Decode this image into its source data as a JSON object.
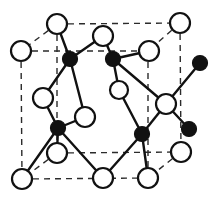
{
  "figure": {
    "name": "diamond-cubic-unit-cell",
    "title": "",
    "caption": "",
    "background_color": "#ffffff",
    "line_color": "#111111",
    "dashed_edge_color": "#2b2b2b",
    "open_atom_fill": "#ffffff",
    "filled_atom_fill": "#111111",
    "atom_radius_open": 10,
    "atom_radius_filled": 7.5,
    "bond_width": 2.4,
    "edge_dash_pattern": "6 5"
  },
  "chart_data": {
    "type": "scatter",
    "xlabel": "",
    "ylabel": "",
    "xlim": [
      0,
      212
    ],
    "ylim": [
      0,
      201
    ],
    "grid": false,
    "legend": [
      {
        "label": "open circle atom",
        "marker": "circle-open",
        "color": "#ffffff"
      },
      {
        "label": "filled circle atom",
        "marker": "circle-filled",
        "color": "#111111"
      }
    ],
    "atoms": [
      {
        "id": "o1",
        "x": 57,
        "y": 24,
        "type": "open",
        "r": 10,
        "position": "top-back-left-corner"
      },
      {
        "id": "o2",
        "x": 180,
        "y": 23,
        "type": "open",
        "r": 10,
        "position": "top-back-right-corner"
      },
      {
        "id": "o3",
        "x": 21,
        "y": 51,
        "type": "open",
        "r": 10,
        "position": "top-front-left-corner"
      },
      {
        "id": "o4",
        "x": 103,
        "y": 36,
        "type": "open",
        "r": 10,
        "position": "top-face-center-left"
      },
      {
        "id": "o5",
        "x": 149,
        "y": 51,
        "type": "open",
        "r": 10,
        "position": "top-face-center-right"
      },
      {
        "id": "o6",
        "x": 43,
        "y": 98,
        "type": "open",
        "r": 10,
        "position": "left-face-center"
      },
      {
        "id": "o7",
        "x": 119,
        "y": 90,
        "type": "open",
        "r": 9,
        "position": "interior-upper-center"
      },
      {
        "id": "o8",
        "x": 85,
        "y": 117,
        "type": "open",
        "r": 10,
        "position": "interior-lower-center"
      },
      {
        "id": "o9",
        "x": 166,
        "y": 104,
        "type": "open",
        "r": 10,
        "position": "right-face-center"
      },
      {
        "id": "o10",
        "x": 57,
        "y": 153,
        "type": "open",
        "r": 10,
        "position": "front-face-center-left"
      },
      {
        "id": "o11",
        "x": 181,
        "y": 152,
        "type": "open",
        "r": 10,
        "position": "bottom-back-right-corner"
      },
      {
        "id": "o12",
        "x": 22,
        "y": 179,
        "type": "open",
        "r": 10,
        "position": "bottom-front-left-corner"
      },
      {
        "id": "o13",
        "x": 103,
        "y": 178,
        "type": "open",
        "r": 10,
        "position": "bottom-face-center"
      },
      {
        "id": "o14",
        "x": 148,
        "y": 178,
        "type": "open",
        "r": 10,
        "position": "bottom-front-right-corner"
      },
      {
        "id": "f1",
        "x": 70,
        "y": 59,
        "type": "filled",
        "r": 7.5,
        "position": "tetrahedral-upper-left"
      },
      {
        "id": "f2",
        "x": 113,
        "y": 59,
        "type": "filled",
        "r": 7.5,
        "position": "tetrahedral-upper-center"
      },
      {
        "id": "f3",
        "x": 200,
        "y": 63,
        "type": "filled",
        "r": 7.5,
        "position": "tetrahedral-upper-right-outside"
      },
      {
        "id": "f4",
        "x": 58,
        "y": 128,
        "type": "filled",
        "r": 7.5,
        "position": "tetrahedral-lower-left"
      },
      {
        "id": "f5",
        "x": 142,
        "y": 134,
        "type": "filled",
        "r": 7.5,
        "position": "tetrahedral-lower-center"
      },
      {
        "id": "f6",
        "x": 189,
        "y": 129,
        "type": "filled",
        "r": 7.5,
        "position": "tetrahedral-lower-right-outside"
      }
    ],
    "bonds": [
      {
        "from": "f1",
        "to": "o1"
      },
      {
        "from": "f1",
        "to": "o4"
      },
      {
        "from": "f1",
        "to": "o6"
      },
      {
        "from": "f1",
        "to": "o8"
      },
      {
        "from": "f2",
        "to": "o4"
      },
      {
        "from": "f2",
        "to": "o5"
      },
      {
        "from": "f2",
        "to": "o7"
      },
      {
        "from": "f2",
        "to": "o9"
      },
      {
        "from": "f3",
        "to": "o9"
      },
      {
        "from": "f4",
        "to": "o6"
      },
      {
        "from": "f4",
        "to": "o8"
      },
      {
        "from": "f4",
        "to": "o10"
      },
      {
        "from": "f4",
        "to": "o12"
      },
      {
        "from": "f4",
        "to": "o13"
      },
      {
        "from": "f5",
        "to": "o7"
      },
      {
        "from": "f5",
        "to": "o9"
      },
      {
        "from": "f5",
        "to": "o13"
      },
      {
        "from": "f5",
        "to": "o14"
      },
      {
        "from": "f6",
        "to": "o9"
      }
    ],
    "cell_edges": [
      {
        "from": [
          57,
          24
        ],
        "to": [
          180,
          23
        ],
        "style": "dashed",
        "name": "top-back-edge"
      },
      {
        "from": [
          57,
          24
        ],
        "to": [
          21,
          51
        ],
        "style": "dashed",
        "name": "top-left-diagonal-edge"
      },
      {
        "from": [
          180,
          23
        ],
        "to": [
          148,
          51
        ],
        "style": "dashed",
        "name": "top-right-diagonal-edge"
      },
      {
        "from": [
          21,
          51
        ],
        "to": [
          148,
          51
        ],
        "style": "dashed",
        "name": "top-front-edge"
      },
      {
        "from": [
          57,
          24
        ],
        "to": [
          57,
          153
        ],
        "style": "dashed",
        "name": "back-left-vertical-edge"
      },
      {
        "from": [
          180,
          23
        ],
        "to": [
          181,
          152
        ],
        "style": "dashed",
        "name": "back-right-vertical-edge"
      },
      {
        "from": [
          21,
          51
        ],
        "to": [
          22,
          179
        ],
        "style": "dashed",
        "name": "front-left-vertical-edge"
      },
      {
        "from": [
          148,
          51
        ],
        "to": [
          148,
          178
        ],
        "style": "dashed",
        "name": "front-right-vertical-edge"
      },
      {
        "from": [
          57,
          153
        ],
        "to": [
          181,
          152
        ],
        "style": "dashed",
        "name": "bottom-back-edge"
      },
      {
        "from": [
          57,
          153
        ],
        "to": [
          22,
          179
        ],
        "style": "dashed",
        "name": "bottom-left-diagonal-edge"
      },
      {
        "from": [
          181,
          152
        ],
        "to": [
          148,
          178
        ],
        "style": "dashed",
        "name": "bottom-right-diagonal-edge"
      },
      {
        "from": [
          22,
          179
        ],
        "to": [
          148,
          178
        ],
        "style": "dashed",
        "name": "bottom-front-edge"
      }
    ]
  }
}
